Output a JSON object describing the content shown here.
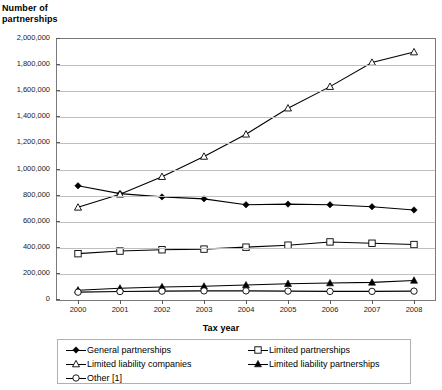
{
  "chart_data": {
    "type": "line",
    "title": "",
    "ylabel": "Number of partnerships",
    "xlabel": "Tax year",
    "grid": true,
    "legend_position": "bottom",
    "ylim": [
      0,
      2000000
    ],
    "ytick_labels": [
      "2,000,000",
      "1,800,000",
      "1,600,000",
      "1,400,000",
      "1,200,000",
      "1,000,000",
      "800,000",
      "600,000",
      "400,000",
      "200,000",
      "0"
    ],
    "ytick_values": [
      2000000,
      1800000,
      1600000,
      1400000,
      1200000,
      1000000,
      800000,
      600000,
      400000,
      200000,
      0
    ],
    "categories": [
      "2000",
      "2001",
      "2002",
      "2003",
      "2004",
      "2005",
      "2006",
      "2007",
      "2008"
    ],
    "x": [
      2000,
      2001,
      2002,
      2003,
      2004,
      2005,
      2006,
      2007,
      2008
    ],
    "series": [
      {
        "name": "General partnerships",
        "marker": "filled-diamond",
        "values": [
          875000,
          815000,
          790000,
          775000,
          730000,
          735000,
          730000,
          715000,
          690000
        ]
      },
      {
        "name": "Limited partnerships",
        "marker": "open-square",
        "values": [
          355000,
          375000,
          385000,
          390000,
          405000,
          420000,
          445000,
          435000,
          425000
        ]
      },
      {
        "name": "Limited liability companies",
        "marker": "open-triangle",
        "values": [
          710000,
          810000,
          945000,
          1100000,
          1270000,
          1470000,
          1635000,
          1820000,
          1900000
        ]
      },
      {
        "name": "Limited liability partnerships",
        "marker": "filled-triangle",
        "values": [
          75000,
          90000,
          100000,
          105000,
          115000,
          125000,
          130000,
          135000,
          150000
        ]
      },
      {
        "name": "Other [1]",
        "marker": "open-circle",
        "values": [
          60000,
          65000,
          68000,
          70000,
          70000,
          68000,
          66000,
          66000,
          68000
        ]
      }
    ]
  },
  "axes": {
    "y_title_line1": "Number of",
    "y_title_line2": "partnerships",
    "x_title": "Tax year"
  },
  "legend": {
    "entries": [
      {
        "label": "General partnerships",
        "marker": "filled-diamond"
      },
      {
        "label": "Limited partnerships",
        "marker": "open-square"
      },
      {
        "label": "Limited liability companies",
        "marker": "open-triangle"
      },
      {
        "label": "Limited liability partnerships",
        "marker": "filled-triangle"
      },
      {
        "label": "Other [1]",
        "marker": "open-circle"
      }
    ]
  },
  "colors": {
    "line": "#000000",
    "grid": "#bfbfbf",
    "frame": "#7a7a7a",
    "text": "#000000"
  }
}
